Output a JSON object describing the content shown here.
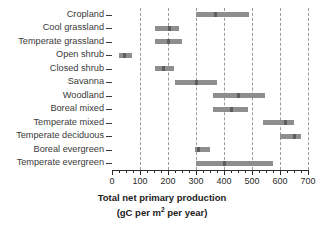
{
  "chart_data": {
    "type": "bar",
    "title": "",
    "xlabel": "Total net primary production (gC per m2 per year)",
    "xlabel_line1": "Total net primary production",
    "xlabel_line2_pre": "(gC per m",
    "xlabel_line2_sup": "2",
    "xlabel_line2_post": " per year)",
    "ylabel": "",
    "xlim": [
      0,
      700
    ],
    "xticks": [
      0,
      100,
      200,
      300,
      400,
      500,
      600,
      700
    ],
    "xtick_labels": [
      "0",
      "100",
      "200",
      "300",
      "400",
      "500",
      "600",
      "700"
    ],
    "minor_tick_step": 25,
    "grid": "vertical-dashed",
    "legend": "none",
    "orientation": "horizontal",
    "categories": [
      "Cropland",
      "Cool grassland",
      "Temperate grassland",
      "Open shrub",
      "Closed shrub",
      "Savanna",
      "Woodland",
      "Boreal mixed",
      "Temperate mixed",
      "Temperate deciduous",
      "Boreal evergreen",
      "Temperate evergreen"
    ],
    "ranges": [
      {
        "category": "Cropland",
        "low": 300,
        "high": 490,
        "median": 370
      },
      {
        "category": "Cool grassland",
        "low": 155,
        "high": 240,
        "median": 205
      },
      {
        "category": "Temperate grassland",
        "low": 155,
        "high": 250,
        "median": 200
      },
      {
        "category": "Open shrub",
        "low": 25,
        "high": 70,
        "median": 45
      },
      {
        "category": "Closed shrub",
        "low": 155,
        "high": 220,
        "median": 185
      },
      {
        "category": "Savanna",
        "low": 225,
        "high": 375,
        "median": 300
      },
      {
        "category": "Woodland",
        "low": 360,
        "high": 545,
        "median": 450
      },
      {
        "category": "Boreal mixed",
        "low": 360,
        "high": 485,
        "median": 425
      },
      {
        "category": "Temperate mixed",
        "low": 540,
        "high": 650,
        "median": 620
      },
      {
        "category": "Temperate deciduous",
        "low": 600,
        "high": 675,
        "median": 650
      },
      {
        "category": "Boreal evergreen",
        "low": 295,
        "high": 350,
        "median": 310
      },
      {
        "category": "Temperate evergreen",
        "low": 300,
        "high": 575,
        "median": 400
      }
    ],
    "colors": {
      "bar": "#8e8e8e",
      "median": "#5e5e5e",
      "grid": "#9a9a9a",
      "axis": "#2b2b2b",
      "background": "#ffffff"
    }
  }
}
